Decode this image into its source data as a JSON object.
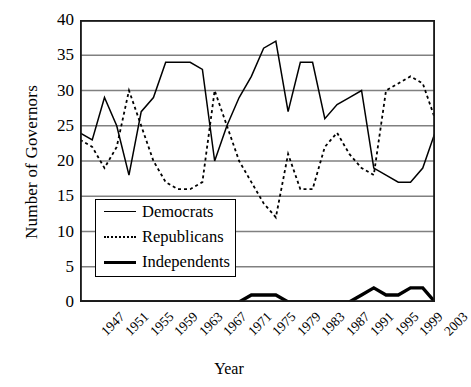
{
  "chart_data": {
    "type": "line",
    "title": "",
    "xlabel": "Year",
    "ylabel": "Number of Governors",
    "xlim": [
      1947,
      2005
    ],
    "ylim": [
      0,
      40
    ],
    "yticks": [
      0,
      5,
      10,
      15,
      20,
      25,
      30,
      35,
      40
    ],
    "xticks": [
      1947,
      1951,
      1955,
      1959,
      1963,
      1967,
      1971,
      1975,
      1979,
      1983,
      1987,
      1991,
      1995,
      1999,
      2003
    ],
    "grid": "horizontal",
    "legend_position": "center-left",
    "x": [
      1947,
      1949,
      1951,
      1953,
      1955,
      1957,
      1959,
      1961,
      1963,
      1965,
      1967,
      1969,
      1971,
      1973,
      1975,
      1977,
      1979,
      1981,
      1983,
      1985,
      1987,
      1989,
      1991,
      1993,
      1995,
      1997,
      1999,
      2001,
      2003,
      2005
    ],
    "series": [
      {
        "name": "Democrats",
        "style": "solid-thin",
        "color": "#000000",
        "values": [
          24,
          23,
          29,
          25,
          18,
          27,
          29,
          34,
          34,
          34,
          33,
          20,
          25,
          29,
          32,
          36,
          37,
          27,
          34,
          34,
          26,
          28,
          29,
          30,
          19,
          18,
          17,
          17,
          19,
          24
        ]
      },
      {
        "name": "Republicans",
        "style": "dotted",
        "color": "#000000",
        "values": [
          23,
          22,
          19,
          22,
          30,
          25,
          20,
          17,
          16,
          16,
          17,
          30,
          25,
          20,
          17,
          14,
          12,
          21,
          16,
          16,
          22,
          24,
          21,
          19,
          18,
          30,
          31,
          32,
          31,
          26
        ]
      },
      {
        "name": "Independents",
        "style": "solid-thick",
        "color": "#000000",
        "values": [
          0,
          0,
          0,
          0,
          0,
          0,
          0,
          0,
          0,
          0,
          0,
          0,
          0,
          0,
          1,
          1,
          1,
          0,
          0,
          0,
          0,
          0,
          0,
          1,
          2,
          1,
          1,
          2,
          2,
          0
        ]
      }
    ]
  },
  "axis": {
    "ylabel": "Number of Governors",
    "xlabel": "Year"
  },
  "legend": {
    "items": [
      {
        "label": "Democrats",
        "style": "solid-thin"
      },
      {
        "label": "Republicans",
        "style": "dotted"
      },
      {
        "label": "Independents",
        "style": "solid-thick"
      }
    ]
  }
}
